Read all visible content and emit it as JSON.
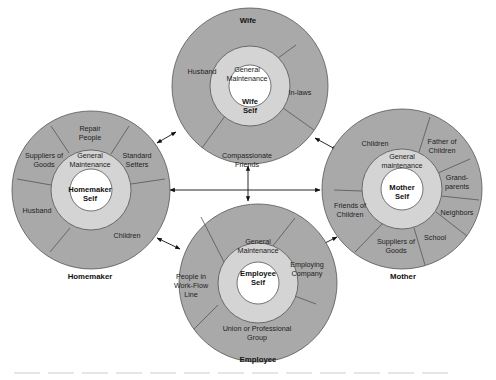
{
  "diagram": {
    "type": "role-relationship-circles",
    "roles": [
      {
        "id": "wife",
        "title": "Wife",
        "self_label": [
          "Wife",
          "Self"
        ],
        "inner_ring": [
          "General",
          "Maintenance"
        ],
        "segments": [
          {
            "label": [
              "Husband"
            ]
          },
          {
            "label": [
              "In-laws"
            ]
          },
          {
            "label": [
              "Compassionate",
              "Friends"
            ]
          }
        ]
      },
      {
        "id": "homemaker",
        "title": "Homemaker",
        "self_label": [
          "Homemaker",
          "Self"
        ],
        "inner_ring": [
          "General",
          "Maintenance"
        ],
        "segments": [
          {
            "label": [
              "Repair",
              "People"
            ]
          },
          {
            "label": [
              "Standard",
              "Setters"
            ]
          },
          {
            "label": [
              "Children"
            ]
          },
          {
            "label": [
              "Husband"
            ]
          },
          {
            "label": [
              "Suppliers of",
              "Goods"
            ]
          }
        ]
      },
      {
        "id": "mother",
        "title": "Mother",
        "self_label": [
          "Mother",
          "Self"
        ],
        "inner_ring": [
          "General",
          "maintenance"
        ],
        "segments": [
          {
            "label": [
              "Children"
            ]
          },
          {
            "label": [
              "Father of",
              "Children"
            ]
          },
          {
            "label": [
              "Grand-",
              "parents"
            ]
          },
          {
            "label": [
              "Neighbors"
            ]
          },
          {
            "label": [
              "School"
            ]
          },
          {
            "label": [
              "Suppliers of",
              "Goods"
            ]
          },
          {
            "label": [
              "Friends of",
              "Children"
            ]
          }
        ]
      },
      {
        "id": "employee",
        "title": "Employee",
        "self_label": [
          "Employee",
          "Self"
        ],
        "inner_ring": [
          "General",
          "Maintenance"
        ],
        "segments": [
          {
            "label": [
              "Employing",
              "Company"
            ]
          },
          {
            "label": [
              "Union or Professional",
              "Group"
            ]
          },
          {
            "label": [
              "People in",
              "Work-Flow",
              "Line"
            ]
          }
        ]
      }
    ],
    "connections": [
      {
        "from": "wife",
        "to": "homemaker",
        "style": "double-arrow"
      },
      {
        "from": "wife",
        "to": "mother",
        "style": "double-arrow"
      },
      {
        "from": "wife",
        "to": "employee",
        "style": "double-arrow"
      },
      {
        "from": "homemaker",
        "to": "mother",
        "style": "double-arrow"
      },
      {
        "from": "homemaker",
        "to": "employee",
        "style": "double-arrow"
      },
      {
        "from": "mother",
        "to": "employee",
        "style": "double-arrow"
      }
    ],
    "colors": {
      "outer_ring": "#a9a9a9",
      "inner_ring": "#d4d4d4",
      "core": "#ffffff",
      "stroke": "#555555"
    }
  }
}
